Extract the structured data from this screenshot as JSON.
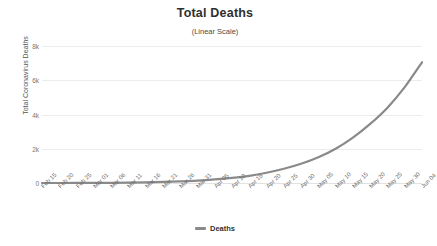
{
  "chart_data": {
    "type": "line",
    "title": "Total Deaths",
    "subtitle": "(Linear Scale)",
    "xlabel": "",
    "ylabel": "Total Coronavirus Deaths",
    "ylim": [
      0,
      8000
    ],
    "grid": true,
    "legend_position": "bottom",
    "line_color": "#8a8a8a",
    "gridline_color": "#ececec",
    "y_ticks": [
      {
        "value": 8000,
        "label": "8k"
      },
      {
        "value": 6000,
        "label": "6k"
      },
      {
        "value": 4000,
        "label": "4k"
      },
      {
        "value": 2000,
        "label": "2k"
      },
      {
        "value": 0,
        "label": "0"
      }
    ],
    "categories": [
      "Feb 15",
      "Feb 20",
      "Feb 25",
      "Mar 01",
      "Mar 06",
      "Mar 11",
      "Mar 16",
      "Mar 21",
      "Mar 26",
      "Mar 31",
      "Apr 05",
      "Apr 10",
      "Apr 15",
      "Apr 20",
      "Apr 25",
      "Apr 30",
      "May 05",
      "May 10",
      "May 15",
      "May 20",
      "May 25",
      "May 30",
      "Jun 04"
    ],
    "series": [
      {
        "name": "Deaths",
        "values": [
          0,
          0,
          2,
          5,
          10,
          20,
          35,
          60,
          95,
          140,
          210,
          300,
          420,
          600,
          830,
          1120,
          1500,
          2000,
          2650,
          3450,
          4400,
          5600,
          7050
        ]
      }
    ]
  },
  "legend": {
    "items": [
      {
        "label": "Deaths",
        "color": "#8a8a8a"
      }
    ]
  }
}
